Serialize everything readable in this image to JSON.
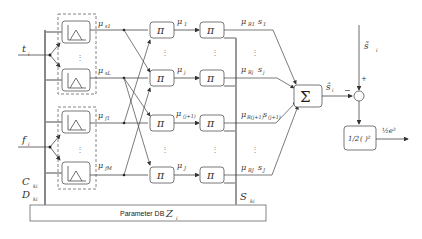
{
  "diagram": {
    "inputs": {
      "t": "t",
      "t_sub": "i",
      "f": "f",
      "f_sub": "i",
      "C": "C",
      "C_sub": "ki",
      "D": "D",
      "D_sub": "ki"
    },
    "membership_outputs": [
      {
        "mu": "μ",
        "sub": "F",
        "subsub": "s1"
      },
      {
        "mu": "μ",
        "sub": "F",
        "subsub": "sL"
      },
      {
        "mu": "μ",
        "sub": "F",
        "subsub": "f1"
      },
      {
        "mu": "μ",
        "sub": "F",
        "subsub": "fM"
      }
    ],
    "product_symbol": "π",
    "rule_labels": [
      {
        "mu": "μ",
        "sub": "R",
        "subsub": "1"
      },
      {
        "mu": "μ",
        "sub": "R",
        "subsub": "j"
      },
      {
        "mu": "μ",
        "sub": "R",
        "subsub": "(j+1)"
      },
      {
        "mu": "μ",
        "sub": "R",
        "subsub": "J"
      }
    ],
    "weighted_labels": [
      {
        "text": "μ",
        "sub": "R1",
        "s": "s",
        "s_sub": "1"
      },
      {
        "text": "μ",
        "sub": "Rj",
        "s": "s",
        "s_sub": "j"
      },
      {
        "text": "μ",
        "sub": "R(j+1)",
        "s": "s",
        "s_sub": "(j+1)"
      },
      {
        "text": "μ",
        "sub": "RJ",
        "s": "s",
        "s_sub": "J"
      }
    ],
    "sum_symbol": "Σ",
    "s_hat": "ŝ",
    "s_hat_sub": "i",
    "minus": "−",
    "plus": "+",
    "s_tilde": "s̃",
    "s_tilde_sub": "i",
    "loss_block": "½(·)²",
    "loss_block_half": "1/2",
    "loss_block_fn": "( )²",
    "loss_output": "½e²",
    "S_label": "S",
    "S_sub": "ki",
    "param_db": "Parameter DB",
    "Z": "Z",
    "Z_sub": "i",
    "vdots": "⋮"
  }
}
